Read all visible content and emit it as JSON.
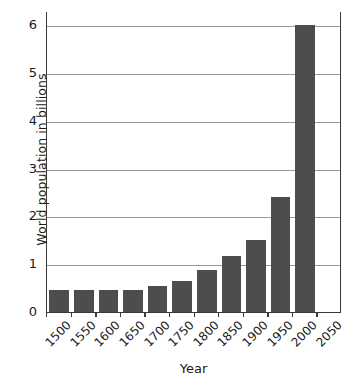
{
  "chart_data": {
    "type": "bar",
    "title": "",
    "xlabel": "Year",
    "ylabel": "World population in billions",
    "categories": [
      "1500",
      "1550",
      "1600",
      "1650",
      "1700",
      "1750",
      "1800",
      "1850",
      "1900",
      "1950",
      "2000",
      "2050"
    ],
    "values": [
      0.46,
      0.46,
      0.47,
      0.46,
      0.55,
      0.65,
      0.87,
      1.17,
      1.5,
      2.4,
      6.0,
      null
    ],
    "ylim": [
      0,
      6.3
    ],
    "y_ticks": [
      "0",
      "1",
      "2",
      "3",
      "4",
      "5",
      "6"
    ],
    "y_tick_values": [
      0,
      1,
      2,
      3,
      4,
      5,
      6
    ],
    "grid": "horizontal",
    "legend": "none",
    "bar_color": "#4d4d4d",
    "gridline_color": "#9a9a9a",
    "axis_color": "#3a3a3a",
    "x_tick_rotation": -45
  }
}
